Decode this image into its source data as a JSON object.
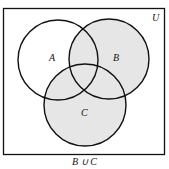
{
  "diagram": {
    "type": "venn",
    "universe_label": "U",
    "sets": [
      {
        "name": "A",
        "label": "A",
        "shaded": false
      },
      {
        "name": "B",
        "label": "B",
        "shaded": true
      },
      {
        "name": "C",
        "label": "C",
        "shaded": true
      }
    ],
    "shaded_region": "B ∪ C",
    "caption": "B ∪ C",
    "colors": {
      "shade": "#e6e6e6",
      "stroke": "#111111",
      "background": "#ffffff"
    }
  }
}
